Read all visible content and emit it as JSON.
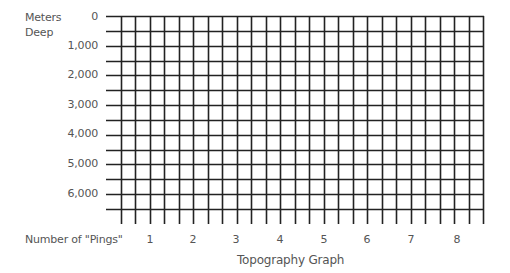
{
  "title": "Topography Graph",
  "y_axis": {
    "label_line1": "Meters",
    "label_line2": "Deep",
    "ticks": [
      "0",
      "1,000",
      "2,000",
      "3,000",
      "4,000",
      "5,000",
      "6,000"
    ]
  },
  "x_axis": {
    "label": "Number of \"Pings\"",
    "ticks": [
      "1",
      "2",
      "3",
      "4",
      "5",
      "6",
      "7",
      "8"
    ]
  },
  "grid": {
    "line_color": "#222222",
    "horizontal_lines": 14,
    "vertical_lines": 26
  },
  "chart_data": {
    "type": "table",
    "title": "Topography Graph",
    "xlabel": "Number of \"Pings\"",
    "ylabel": "Meters Deep",
    "x_ticks": [
      1,
      2,
      3,
      4,
      5,
      6,
      7,
      8
    ],
    "y_ticks": [
      0,
      1000,
      2000,
      3000,
      4000,
      5000,
      6000
    ],
    "ylim": [
      0,
      6500
    ],
    "y_inverted": true,
    "grid": true,
    "series": []
  }
}
